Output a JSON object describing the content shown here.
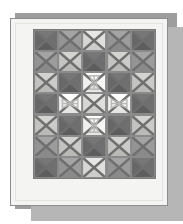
{
  "artwork": {
    "title": "Patchwork quilt photograph",
    "subject": "quilt",
    "presentation": "framed print with drop shadow",
    "grid": {
      "columns": 5,
      "rows": 7
    },
    "block_type": "four-patch square-in-a-square (X seam)",
    "background_color": "#ffffff",
    "mat_color": "#f4f4f2",
    "mat_border_color": "#8d8d8d",
    "shadow_color": "#9d9d9d",
    "shadow_inner_color": "#b6b6b6",
    "seam_color": "#6f6f6f",
    "sashing_color": "#8a8a8a"
  },
  "palette": {
    "dark": "#6d6d6d",
    "medium": "#9a9a9a",
    "light": "#c9c9c6",
    "pale": "#ddddd9",
    "white": "#f6f6f4",
    "motif_line": "#b9b9b5"
  },
  "blocks": [
    {
      "row": 1,
      "col": 1,
      "tone": "dark",
      "color": "#6d6d6d",
      "motif": "none"
    },
    {
      "row": 1,
      "col": 2,
      "tone": "medium",
      "color": "#9a9a9a",
      "motif": "none"
    },
    {
      "row": 1,
      "col": 3,
      "tone": "pale",
      "color": "#ddddd9",
      "motif": "none"
    },
    {
      "row": 1,
      "col": 4,
      "tone": "medium",
      "color": "#9a9a9a",
      "motif": "none"
    },
    {
      "row": 1,
      "col": 5,
      "tone": "dark",
      "color": "#6d6d6d",
      "motif": "none"
    },
    {
      "row": 2,
      "col": 1,
      "tone": "medium",
      "color": "#9a9a9a",
      "motif": "none"
    },
    {
      "row": 2,
      "col": 2,
      "tone": "light",
      "color": "#c9c9c6",
      "motif": "none"
    },
    {
      "row": 2,
      "col": 3,
      "tone": "dark",
      "color": "#6d6d6d",
      "motif": "none"
    },
    {
      "row": 2,
      "col": 4,
      "tone": "light",
      "color": "#c9c9c6",
      "motif": "none"
    },
    {
      "row": 2,
      "col": 5,
      "tone": "medium",
      "color": "#9a9a9a",
      "motif": "none"
    },
    {
      "row": 3,
      "col": 1,
      "tone": "light",
      "color": "#c9c9c6",
      "motif": "none"
    },
    {
      "row": 3,
      "col": 2,
      "tone": "dark",
      "color": "#6d6d6d",
      "motif": "none"
    },
    {
      "row": 3,
      "col": 3,
      "tone": "white",
      "color": "#f6f6f4",
      "motif": "hourglass-vertical"
    },
    {
      "row": 3,
      "col": 4,
      "tone": "dark",
      "color": "#6d6d6d",
      "motif": "none"
    },
    {
      "row": 3,
      "col": 5,
      "tone": "light",
      "color": "#c9c9c6",
      "motif": "none"
    },
    {
      "row": 4,
      "col": 1,
      "tone": "dark",
      "color": "#6d6d6d",
      "motif": "none"
    },
    {
      "row": 4,
      "col": 2,
      "tone": "white",
      "color": "#f6f6f4",
      "motif": "bowtie-horizontal"
    },
    {
      "row": 4,
      "col": 3,
      "tone": "pale",
      "color": "#ddddd9",
      "motif": "none"
    },
    {
      "row": 4,
      "col": 4,
      "tone": "white",
      "color": "#f6f6f4",
      "motif": "bowtie-horizontal"
    },
    {
      "row": 4,
      "col": 5,
      "tone": "dark",
      "color": "#6d6d6d",
      "motif": "none"
    },
    {
      "row": 5,
      "col": 1,
      "tone": "light",
      "color": "#c9c9c6",
      "motif": "none"
    },
    {
      "row": 5,
      "col": 2,
      "tone": "dark",
      "color": "#6d6d6d",
      "motif": "none"
    },
    {
      "row": 5,
      "col": 3,
      "tone": "white",
      "color": "#f6f6f4",
      "motif": "hourglass-vertical"
    },
    {
      "row": 5,
      "col": 4,
      "tone": "dark",
      "color": "#6d6d6d",
      "motif": "none"
    },
    {
      "row": 5,
      "col": 5,
      "tone": "light",
      "color": "#c9c9c6",
      "motif": "none"
    },
    {
      "row": 6,
      "col": 1,
      "tone": "medium",
      "color": "#9a9a9a",
      "motif": "none"
    },
    {
      "row": 6,
      "col": 2,
      "tone": "light",
      "color": "#c9c9c6",
      "motif": "none"
    },
    {
      "row": 6,
      "col": 3,
      "tone": "dark",
      "color": "#6d6d6d",
      "motif": "none"
    },
    {
      "row": 6,
      "col": 4,
      "tone": "light",
      "color": "#c9c9c6",
      "motif": "none"
    },
    {
      "row": 6,
      "col": 5,
      "tone": "medium",
      "color": "#9a9a9a",
      "motif": "none"
    },
    {
      "row": 7,
      "col": 1,
      "tone": "dark",
      "color": "#6d6d6d",
      "motif": "none"
    },
    {
      "row": 7,
      "col": 2,
      "tone": "medium",
      "color": "#9a9a9a",
      "motif": "none"
    },
    {
      "row": 7,
      "col": 3,
      "tone": "pale",
      "color": "#ddddd9",
      "motif": "none"
    },
    {
      "row": 7,
      "col": 4,
      "tone": "medium",
      "color": "#9a9a9a",
      "motif": "none"
    },
    {
      "row": 7,
      "col": 5,
      "tone": "dark",
      "color": "#6d6d6d",
      "motif": "none"
    }
  ]
}
